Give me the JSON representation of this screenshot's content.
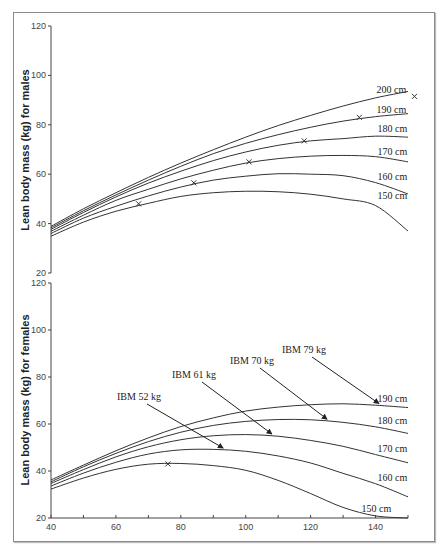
{
  "chart_data": [
    {
      "type": "line",
      "title": "",
      "ylabel": "Lean body mass (kg) for males",
      "xlabel": "",
      "xlim": [
        40,
        150
      ],
      "ylim": [
        20,
        120
      ],
      "yticks": [
        "120",
        "100",
        "80",
        "60",
        "40",
        "20"
      ],
      "ytick_values": [
        120,
        100,
        80,
        60,
        40,
        20
      ],
      "x": [
        40,
        50,
        60,
        70,
        80,
        90,
        100,
        110,
        120,
        130,
        140,
        150
      ],
      "series": [
        {
          "name": "150 cm",
          "values": [
            34.9,
            40.6,
            45.0,
            48.2,
            51.0,
            52.5,
            53.1,
            52.9,
            51.9,
            50.0,
            47.3,
            37.0
          ]
        },
        {
          "name": "160 cm",
          "values": [
            36.0,
            42.2,
            47.0,
            51.2,
            54.8,
            57.6,
            59.2,
            60.2,
            60.0,
            59.4,
            56.6,
            52.0
          ]
        },
        {
          "name": "170 cm",
          "values": [
            36.9,
            43.4,
            49.4,
            53.9,
            58.1,
            61.6,
            64.5,
            66.3,
            67.3,
            67.6,
            67.1,
            65.0
          ]
        },
        {
          "name": "180 cm",
          "values": [
            37.7,
            44.5,
            50.8,
            56.4,
            61.2,
            65.5,
            69.0,
            71.7,
            73.5,
            74.4,
            75.4,
            75.0
          ]
        },
        {
          "name": "190 cm",
          "values": [
            38.3,
            45.2,
            51.6,
            57.6,
            63.2,
            68.3,
            72.5,
            76.0,
            79.0,
            81.5,
            83.3,
            84.5
          ]
        },
        {
          "name": "200 cm",
          "values": [
            38.9,
            46.0,
            52.5,
            58.7,
            64.5,
            69.9,
            75.0,
            79.7,
            83.8,
            87.6,
            90.9,
            93.5
          ]
        }
      ],
      "markers": [
        {
          "series": "150 cm",
          "x": 67,
          "y": 48
        },
        {
          "series": "160 cm",
          "x": 84,
          "y": 56.5
        },
        {
          "series": "170 cm",
          "x": 101,
          "y": 65
        },
        {
          "series": "180 cm",
          "x": 118,
          "y": 73.5
        },
        {
          "series": "190 cm",
          "x": 135,
          "y": 83
        },
        {
          "series": "200 cm",
          "x": 152,
          "y": 91.5
        }
      ],
      "series_labels": [
        "200 cm",
        "190 cm",
        "180 cm",
        "170 cm",
        "160 cm",
        "150 cm"
      ]
    },
    {
      "type": "line",
      "title": "",
      "ylabel": "Lean body mass (kg) for females",
      "xlabel": "",
      "xlim": [
        40,
        150
      ],
      "ylim": [
        20,
        120
      ],
      "xticks": [
        "40",
        "60",
        "80",
        "100",
        "120",
        "140"
      ],
      "xtick_values": [
        40,
        60,
        80,
        100,
        120,
        140
      ],
      "yticks": [
        "120",
        "100",
        "80",
        "60",
        "40",
        "20"
      ],
      "ytick_values": [
        120,
        100,
        80,
        60,
        40,
        20
      ],
      "x": [
        40,
        50,
        60,
        70,
        80,
        90,
        100,
        110,
        120,
        130,
        140,
        150
      ],
      "series": [
        {
          "name": "150 cm",
          "values": [
            32.3,
            37.0,
            40.7,
            42.9,
            43.2,
            42.3,
            40.3,
            36.0,
            30.4,
            24.5,
            20.9,
            16.0
          ]
        },
        {
          "name": "160 cm",
          "values": [
            33.6,
            39.1,
            43.7,
            47.2,
            49.0,
            49.2,
            48.4,
            46.4,
            43.4,
            39.0,
            34.6,
            29.0
          ]
        },
        {
          "name": "170 cm",
          "values": [
            34.7,
            40.6,
            46.0,
            50.3,
            53.3,
            55.0,
            55.5,
            54.8,
            53.0,
            50.5,
            47.0,
            43.5
          ]
        },
        {
          "name": "180 cm",
          "values": [
            35.4,
            41.8,
            47.5,
            52.5,
            56.5,
            59.4,
            61.1,
            61.9,
            61.8,
            60.7,
            58.8,
            56.0
          ]
        },
        {
          "name": "190 cm",
          "values": [
            36.2,
            42.5,
            48.6,
            54.1,
            58.9,
            62.6,
            65.5,
            67.2,
            68.2,
            68.6,
            68.0,
            67.0
          ]
        }
      ],
      "markers": [
        {
          "series": "150 cm",
          "x": 76,
          "y": 43
        }
      ],
      "series_labels": [
        "190 cm",
        "180 cm",
        "170 cm",
        "160 cm",
        "150 cm"
      ],
      "annotations": [
        {
          "text": "IBM 52 kg",
          "points_to_series": "160 cm",
          "arrow_x": 93
        },
        {
          "text": "IBM 61 kg",
          "points_to_series": "170 cm",
          "arrow_x": 108
        },
        {
          "text": "IBM 70 kg",
          "points_to_series": "180 cm",
          "arrow_x": 125
        },
        {
          "text": "IBM 79 kg",
          "points_to_series": "190 cm",
          "arrow_x": 141
        }
      ]
    }
  ]
}
